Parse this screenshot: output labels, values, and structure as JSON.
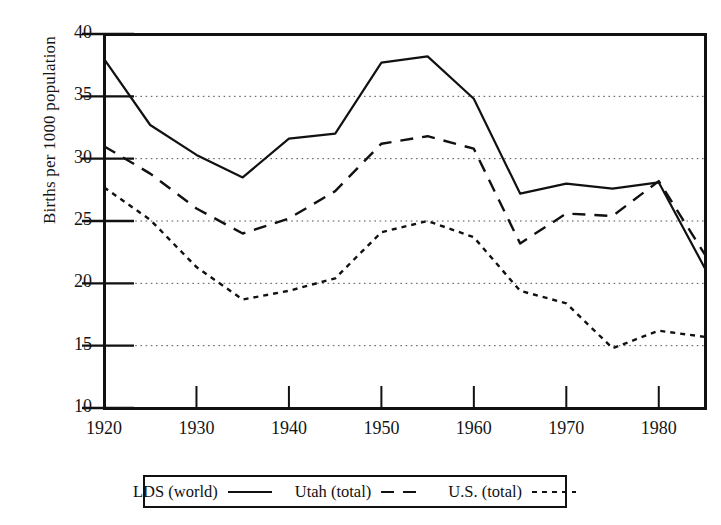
{
  "chart_data": {
    "type": "line",
    "title": "",
    "subtitle": "",
    "xlabel": "",
    "ylabel": "Births per 1000 population",
    "xlim": [
      1920,
      1985
    ],
    "ylim": [
      10,
      40
    ],
    "xticks": [
      1920,
      1930,
      1940,
      1950,
      1960,
      1970,
      1980
    ],
    "yticks": [
      10,
      15,
      20,
      25,
      30,
      35,
      40
    ],
    "grid": "horizontal-dotted",
    "legend_position": "below-plot",
    "x": [
      1920,
      1925,
      1930,
      1935,
      1940,
      1945,
      1950,
      1955,
      1960,
      1965,
      1970,
      1975,
      1980,
      1985
    ],
    "series": [
      {
        "name": "LDS (world)",
        "style": "solid",
        "color": "#111111",
        "values": [
          38.0,
          32.7,
          30.3,
          28.5,
          31.6,
          32.0,
          37.7,
          38.2,
          34.8,
          27.2,
          28.0,
          27.6,
          28.1,
          21.2
        ]
      },
      {
        "name": "Utah (total)",
        "style": "dashed",
        "color": "#111111",
        "values": [
          31.0,
          28.8,
          26.0,
          24.0,
          25.2,
          27.4,
          31.2,
          31.8,
          30.8,
          23.2,
          25.6,
          25.4,
          28.2,
          22.3
        ]
      },
      {
        "name": "U.S. (total)",
        "style": "dotted",
        "color": "#111111",
        "values": [
          27.7,
          25.1,
          21.3,
          18.7,
          19.4,
          20.4,
          24.1,
          25.0,
          23.7,
          19.4,
          18.4,
          14.8,
          16.2,
          15.7
        ]
      }
    ]
  },
  "legend": {
    "entries": [
      {
        "label": "LDS (world)",
        "style": "solid"
      },
      {
        "label": "Utah (total)",
        "style": "dashed"
      },
      {
        "label": "U.S. (total)",
        "style": "dotted"
      }
    ]
  },
  "axis": {
    "y_title": "Births per 1000 population",
    "y_ticks": [
      "40",
      "35",
      "30",
      "25",
      "20",
      "15",
      "10"
    ],
    "x_ticks": [
      "1920",
      "1930",
      "1940",
      "1950",
      "1960",
      "1970",
      "1980"
    ]
  }
}
